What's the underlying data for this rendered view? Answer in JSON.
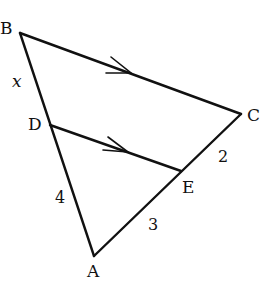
{
  "diagram": {
    "type": "triangle with parallel segment",
    "points": {
      "A": {
        "label": "A",
        "x": 94,
        "y": 256
      },
      "B": {
        "label": "B",
        "x": 20,
        "y": 33
      },
      "C": {
        "label": "C",
        "x": 241,
        "y": 114
      },
      "D": {
        "label": "D",
        "x": 50,
        "y": 125
      },
      "E": {
        "label": "E",
        "x": 181,
        "y": 171
      }
    },
    "segment_labels": {
      "BD": "x",
      "DA": "4",
      "AE": "3",
      "EC": "2"
    },
    "parallel_marks": {
      "BC": "single-arrow",
      "DE": "single-arrow"
    },
    "line_color": "#111111"
  }
}
